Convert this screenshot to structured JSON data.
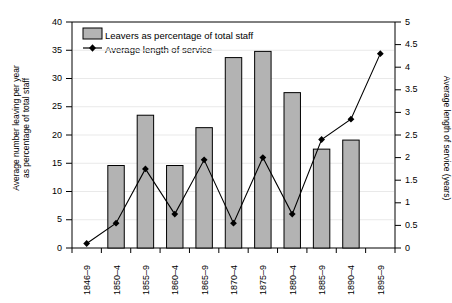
{
  "chart_data": {
    "type": "bar",
    "title": "",
    "subtitle": "",
    "xlabel": "",
    "ylabel": "Average number leaving per year as percentage of total staff",
    "ylabel_line1": "Average number leaving per year",
    "ylabel_line2": "as percentage of total staff",
    "y2label": "Average length of service (years)",
    "categories": [
      "1846–9",
      "1850–4",
      "1855–9",
      "1860–4",
      "1865–9",
      "1870–4",
      "1875–9",
      "1880–4",
      "1885–9",
      "1890–4",
      "1895–9"
    ],
    "ylim": [
      0,
      40
    ],
    "yticks": [
      0,
      5,
      10,
      15,
      20,
      25,
      30,
      35,
      40
    ],
    "ytick_labels": [
      "0",
      "5",
      "10",
      "15",
      "20",
      "25",
      "30",
      "35",
      "40"
    ],
    "y2lim": [
      0,
      5
    ],
    "y2ticks": [
      0,
      0.5,
      1,
      1.5,
      2,
      2.5,
      3,
      3.5,
      4,
      4.5,
      5
    ],
    "y2tick_labels": [
      "0",
      "0.5",
      "1",
      "1.5",
      "2",
      "2.5",
      "3",
      "3.5",
      "4",
      "4.5",
      "5"
    ],
    "grid": false,
    "legend_position": "upper-left-inside",
    "series": [
      {
        "name": "Leavers as percentage of total staff",
        "type": "bar",
        "axis": "left",
        "color": "#b3b3b3",
        "edge_color": "#000000",
        "values": [
          null,
          14.6,
          23.5,
          14.6,
          21.3,
          33.7,
          34.8,
          27.5,
          17.5,
          19.1,
          null
        ]
      },
      {
        "name": "Average length of service",
        "type": "line",
        "axis": "right",
        "color": "#000000",
        "marker": "diamond",
        "values": [
          0.1,
          0.55,
          1.75,
          0.75,
          1.95,
          0.55,
          2.0,
          0.75,
          2.4,
          2.85,
          4.3
        ]
      }
    ]
  },
  "legend": {
    "items": [
      {
        "label": "Leavers as percentage of total staff",
        "marker": "swatch"
      },
      {
        "label": "Average length of service",
        "marker": "diamond-line"
      }
    ]
  }
}
